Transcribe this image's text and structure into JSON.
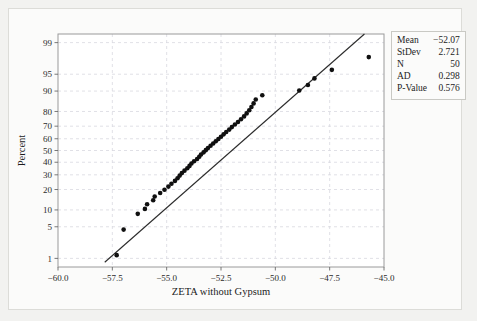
{
  "chart_data": {
    "type": "scatter",
    "title": "",
    "subtitle": "",
    "xlabel": "ZETA without Gypsum",
    "ylabel": "Percent",
    "xlim": [
      -60.0,
      -45.0
    ],
    "xticks": [
      "-60.0",
      "-57.5",
      "-55.0",
      "-52.5",
      "-50.0",
      "-47.5",
      "-45.0"
    ],
    "xtick_values": [
      -60.0,
      -57.5,
      -55.0,
      -52.5,
      -50.0,
      -47.5,
      -45.0
    ],
    "yticks": [
      "1",
      "5",
      "10",
      "20",
      "30",
      "40",
      "50",
      "60",
      "70",
      "80",
      "90",
      "95",
      "99"
    ],
    "ytick_values": [
      1,
      5,
      10,
      20,
      30,
      40,
      50,
      60,
      70,
      80,
      90,
      95,
      99
    ],
    "y_scale": "normal-probability",
    "grid": true,
    "legend_position": "outside-top-right",
    "fit_line": {
      "label": "normal fit line",
      "x_start": -57.85,
      "y_start": 0.8,
      "x_end": -45.9,
      "y_end": 99.4
    },
    "points_x": [
      -57.3,
      -56.98,
      -56.33,
      -56.0,
      -55.9,
      -55.62,
      -55.55,
      -55.3,
      -55.1,
      -54.92,
      -54.78,
      -54.62,
      -54.5,
      -54.4,
      -54.3,
      -54.18,
      -54.05,
      -53.95,
      -53.86,
      -53.74,
      -53.6,
      -53.5,
      -53.42,
      -53.3,
      -53.2,
      -53.1,
      -52.98,
      -52.86,
      -52.74,
      -52.62,
      -52.5,
      -52.38,
      -52.26,
      -52.12,
      -52.0,
      -51.86,
      -51.72,
      -51.58,
      -51.44,
      -51.32,
      -51.2,
      -51.1,
      -51.0,
      -50.9,
      -50.6,
      -48.9,
      -48.5,
      -48.2,
      -47.4,
      -45.7
    ],
    "points_y": [
      1.2,
      4.4,
      8.6,
      10.4,
      12.3,
      14.2,
      16.1,
      18.0,
      19.9,
      21.8,
      23.7,
      25.6,
      27.5,
      29.4,
      31.3,
      33.2,
      35.1,
      37.0,
      38.9,
      40.8,
      42.7,
      44.6,
      46.5,
      48.4,
      50.3,
      52.2,
      54.1,
      56.0,
      57.9,
      59.8,
      61.7,
      63.6,
      65.5,
      67.4,
      69.3,
      71.2,
      73.1,
      75.0,
      76.9,
      78.8,
      80.7,
      82.6,
      84.5,
      86.4,
      88.3,
      90.2,
      92.1,
      94.0,
      95.9,
      97.8
    ],
    "marker_color": "#101010",
    "line_color": "#2b2b2b",
    "grid_color": "#d8d8e0"
  },
  "legend": {
    "rows": [
      {
        "key": "Mean",
        "value": "−52.07"
      },
      {
        "key": "StDev",
        "value": "2.721"
      },
      {
        "key": "N",
        "value": "50"
      },
      {
        "key": "AD",
        "value": "0.298"
      },
      {
        "key": "P-Value",
        "value": "0.576"
      }
    ]
  }
}
